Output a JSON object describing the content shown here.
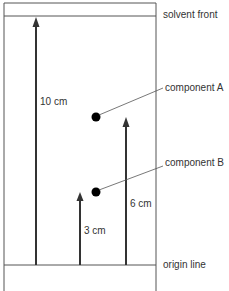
{
  "diagram": {
    "labels": {
      "solvent_front": "solvent front",
      "origin_line": "origin line",
      "component_a": "component A",
      "component_b": "component B"
    },
    "distances": {
      "solvent": "10 cm",
      "component_a": "6 cm",
      "component_b": "3 cm"
    },
    "colors": {
      "line": "#333333",
      "spot": "#000000"
    }
  }
}
